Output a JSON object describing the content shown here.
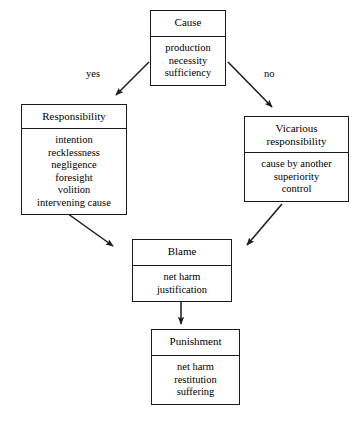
{
  "diagram": {
    "ink_color": "#1a1a1a",
    "background_color": "#ffffff",
    "nodes": [
      {
        "id": "cause",
        "title": "Cause",
        "items_text": "production\nnecessity\nsufficiency",
        "items": [
          "production",
          "necessity",
          "sufficiency"
        ]
      },
      {
        "id": "responsibility",
        "title": "Responsibility",
        "items_text": "intention\nrecklessness\nnegligence\nforesight\nvolition\nintervening cause",
        "items": [
          "intention",
          "recklessness",
          "negligence",
          "foresight",
          "volition",
          "intervening cause"
        ]
      },
      {
        "id": "vicarious",
        "title": "Vicarious\nresponsibility",
        "items_text": "cause by another\nsuperiority\ncontrol",
        "items": [
          "cause by another",
          "superiority",
          "control"
        ]
      },
      {
        "id": "blame",
        "title": "Blame",
        "items_text": "net harm\njustification",
        "items": [
          "net harm",
          "justification"
        ]
      },
      {
        "id": "punishment",
        "title": "Punishment",
        "items_text": "net harm\nrestitution\nsuffering",
        "items": [
          "net harm",
          "restitution",
          "suffering"
        ]
      }
    ],
    "edges": [
      {
        "id": "cause-to-responsibility",
        "from": "cause",
        "to": "responsibility",
        "label": "yes"
      },
      {
        "id": "cause-to-vicarious",
        "from": "cause",
        "to": "vicarious",
        "label": "no"
      },
      {
        "id": "responsibility-to-blame",
        "from": "responsibility",
        "to": "blame",
        "label": ""
      },
      {
        "id": "vicarious-to-blame",
        "from": "vicarious",
        "to": "blame",
        "label": ""
      },
      {
        "id": "blame-to-punishment",
        "from": "blame",
        "to": "punishment",
        "label": ""
      }
    ]
  }
}
